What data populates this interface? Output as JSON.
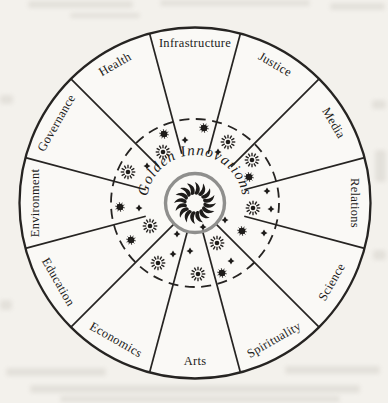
{
  "figure": {
    "type": "wheel-diagram",
    "center_label": "Golden Innovations",
    "sectors": [
      {
        "label": "Infrastructure"
      },
      {
        "label": "Justice"
      },
      {
        "label": "Media"
      },
      {
        "label": "Relations"
      },
      {
        "label": "Science"
      },
      {
        "label": "Spirituality"
      },
      {
        "label": "Arts"
      },
      {
        "label": "Economics"
      },
      {
        "label": "Education"
      },
      {
        "label": "Environment"
      },
      {
        "label": "Governance"
      },
      {
        "label": "Health"
      }
    ],
    "symbols": {
      "ray_stars": [
        [
          163,
          152
        ],
        [
          128,
          172
        ],
        [
          228,
          142
        ],
        [
          252,
          160
        ],
        [
          150,
          226
        ],
        [
          253,
          208
        ],
        [
          217,
          243
        ],
        [
          198,
          274
        ],
        [
          158,
          263
        ]
      ],
      "burst_dots": [
        [
          164,
          134
        ],
        [
          204,
          128
        ],
        [
          120,
          207
        ],
        [
          131,
          240
        ],
        [
          242,
          231
        ],
        [
          222,
          273
        ],
        [
          249,
          177
        ]
      ],
      "diamonds": [
        [
          185,
          140
        ],
        [
          218,
          152
        ],
        [
          147,
          166
        ],
        [
          139,
          208
        ],
        [
          177,
          234
        ],
        [
          190,
          251
        ],
        [
          173,
          254
        ],
        [
          203,
          227
        ],
        [
          225,
          220
        ],
        [
          231,
          261
        ],
        [
          267,
          191
        ],
        [
          271,
          209
        ],
        [
          264,
          233
        ]
      ]
    },
    "colors": {
      "line": "#262422",
      "symbol": "#1e1c1a",
      "center_ring": "#8f8f8d",
      "text": "#1d1c1b",
      "paper": "#f3f1ec",
      "wheel_fill": "#faf9f6"
    }
  }
}
